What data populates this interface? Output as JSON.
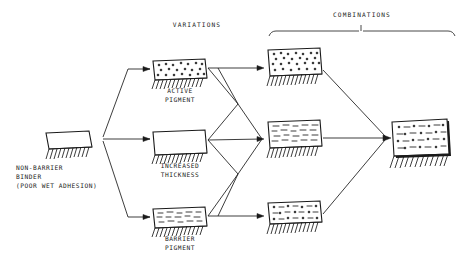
{
  "diagram": {
    "headers": {
      "variations": "VARIATIONS",
      "combinations": "COMBINATIONS"
    },
    "source": {
      "label_line1": "NON-BARRIER",
      "label_line2": "BINDER",
      "label_line3": "(POOR WET ADHESION)",
      "fill": "empty"
    },
    "variations": [
      {
        "label_line1": "ACTIVE",
        "label_line2": "PIGMENT",
        "fill": "dots"
      },
      {
        "label_line1": "INCREASED",
        "label_line2": "THICKNESS",
        "fill": "empty"
      },
      {
        "label_line1": "BARRIER",
        "label_line2": "PIGMENT",
        "fill": "dashes"
      }
    ],
    "combinations": [
      {
        "fill": "dots"
      },
      {
        "fill": "dashes"
      },
      {
        "fill": "mixed"
      }
    ],
    "result": {
      "fill": "mixed"
    },
    "colors": {
      "ink": "#1a1a1a",
      "paper": "#ffffff"
    }
  }
}
